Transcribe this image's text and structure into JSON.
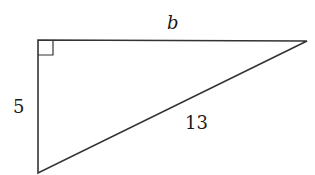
{
  "diagram": {
    "type": "right-triangle",
    "stroke_color": "#333333",
    "vertices": {
      "right_angle": [
        38,
        40
      ],
      "top_right": [
        307,
        41
      ],
      "bottom": [
        38,
        173
      ]
    },
    "right_angle_marker_size": 15,
    "labels": {
      "top_side": "b",
      "left_side": "5",
      "hypotenuse": "13"
    }
  }
}
